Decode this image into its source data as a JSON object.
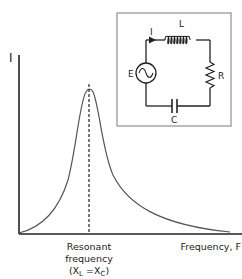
{
  "figure": {
    "y_axis_label": "I",
    "x_axis_label": "Frequency, F",
    "resonance_label": {
      "line1": "Resonant",
      "line2": "frequency",
      "line3_open": "(X",
      "line3_sub_L": "L",
      "line3_mid": " =X",
      "line3_sub_C": "C",
      "line3_close": ")"
    },
    "colors": {
      "axis": "#222222",
      "curve": "#555555",
      "inset_border": "#999999",
      "circuit": "#222222"
    }
  },
  "circuit": {
    "current_label": "I",
    "inductor_label": "L",
    "source_label": "E",
    "resistor_label": "R",
    "capacitor_label": "C"
  }
}
